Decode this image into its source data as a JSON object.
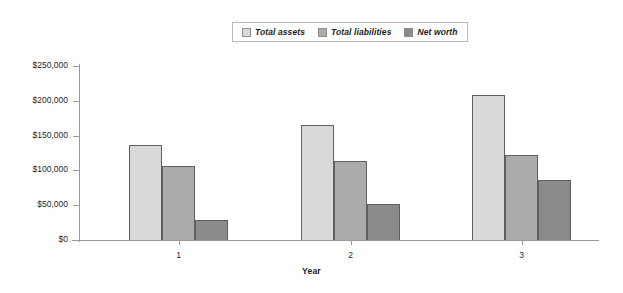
{
  "chart_data": {
    "type": "bar",
    "title": "",
    "subtitle": "",
    "xlabel": "Year",
    "ylabel": "",
    "categories": [
      "1",
      "2",
      "3"
    ],
    "series": [
      {
        "name": "Total assets",
        "values": [
          136000,
          165000,
          208000
        ],
        "color": "#d9d9d9"
      },
      {
        "name": "Total liabilities",
        "values": [
          106000,
          113000,
          122000
        ],
        "color": "#ababab"
      },
      {
        "name": "Net worth",
        "values": [
          29000,
          52000,
          86000
        ],
        "color": "#8a8a8a"
      }
    ],
    "ylim": [
      0,
      250000
    ],
    "ytick_values": [
      250000,
      200000,
      150000,
      100000,
      50000,
      0
    ],
    "ytick_labels": [
      "$250,000",
      "$200,000",
      "$150,000",
      "$100,000",
      "$50,000",
      "$0"
    ],
    "grid": false,
    "legend_position": "top-center"
  },
  "legend": {
    "entries": [
      {
        "label": "Total assets",
        "swatch": "#d9d9d9"
      },
      {
        "label": "Total liabilities",
        "swatch": "#ababab"
      },
      {
        "label": "Net worth",
        "swatch": "#8a8a8a"
      }
    ]
  },
  "axes": {
    "x_title": "Year",
    "x_labels": [
      "1",
      "2",
      "3"
    ],
    "y_labels": [
      "$250,000",
      "$200,000",
      "$150,000",
      "$100,000",
      "$50,000",
      "$0"
    ]
  }
}
